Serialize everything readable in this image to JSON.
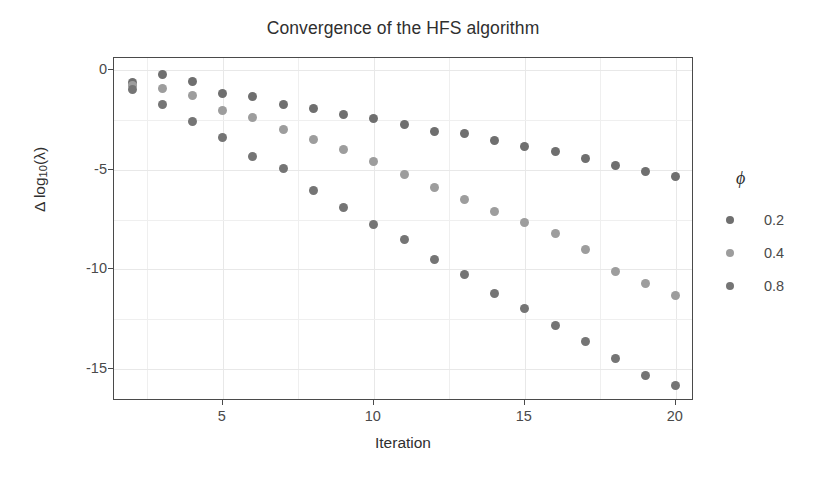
{
  "chart_data": {
    "type": "scatter",
    "title": "Convergence of the HFS algorithm",
    "xlabel": "Iteration",
    "ylabel_parts": {
      "delta": "Δ log",
      "sub": "10",
      "tail": "(λ)"
    },
    "ylabel": "Δ log10(λ)",
    "xlim": [
      1.4,
      20.6
    ],
    "ylim": [
      -16.6,
      0.6
    ],
    "xticks": [
      5,
      10,
      15,
      20
    ],
    "yticks": [
      0,
      -5,
      -10,
      -15
    ],
    "xtick_labels": [
      "5",
      "10",
      "15",
      "20"
    ],
    "ytick_labels": [
      "0",
      "-5",
      "-10",
      "-15"
    ],
    "x_minor_gridlines": [
      2.5,
      7.5,
      12.5,
      17.5
    ],
    "y_minor_gridlines": [
      -2.5,
      -7.5,
      -12.5
    ],
    "grid": true,
    "legend_position": "right",
    "legend_title": "ϕ",
    "x": [
      2,
      3,
      4,
      5,
      6,
      7,
      8,
      9,
      10,
      11,
      12,
      13,
      14,
      15,
      16,
      17,
      18,
      19,
      20
    ],
    "series": [
      {
        "name": "0.2",
        "color": "#6f6f6f",
        "values": [
          -0.62,
          -0.25,
          -0.58,
          -1.2,
          -1.35,
          -1.75,
          -1.95,
          -2.25,
          -2.45,
          -2.75,
          -3.1,
          -3.2,
          -3.55,
          -3.85,
          -4.1,
          -4.45,
          -4.8,
          -5.1,
          -5.35
        ]
      },
      {
        "name": "0.4",
        "color": "#9d9d9d",
        "values": [
          -0.8,
          -0.95,
          -1.3,
          -2.05,
          -2.4,
          -3.0,
          -3.5,
          -4.0,
          -4.6,
          -5.25,
          -5.9,
          -6.5,
          -7.1,
          -7.65,
          -8.2,
          -9.0,
          -10.1,
          -10.7,
          -11.3
        ]
      },
      {
        "name": "0.8",
        "color": "#757575",
        "values": [
          -1.0,
          -1.75,
          -2.6,
          -3.4,
          -4.35,
          -4.95,
          -6.05,
          -6.9,
          -7.75,
          -8.5,
          -9.5,
          -10.25,
          -11.2,
          -11.95,
          -12.8,
          -13.6,
          -14.45,
          -15.3,
          -15.8
        ]
      }
    ]
  }
}
